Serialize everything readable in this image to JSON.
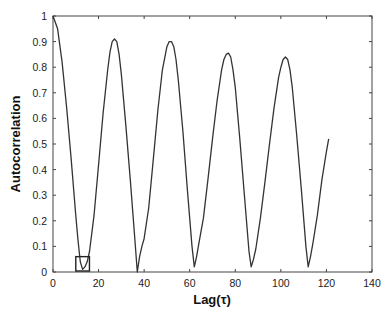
{
  "chart_data": {
    "type": "line",
    "title": "",
    "xlabel": "Lag(τ)",
    "ylabel": "Autocorrelation",
    "xlim": [
      0,
      140
    ],
    "ylim": [
      0,
      1
    ],
    "xticks": [
      0,
      20,
      40,
      60,
      80,
      100,
      120,
      140
    ],
    "yticks": [
      0,
      0.1,
      0.2,
      0.3,
      0.4,
      0.5,
      0.6,
      0.7,
      0.8,
      0.9,
      1
    ],
    "grid": false,
    "legend": null,
    "series": [
      {
        "name": "autocorrelation",
        "color": "#333333",
        "x": [
          0,
          2,
          4,
          6,
          8,
          10,
          11,
          12,
          13,
          14,
          15,
          16,
          18,
          20,
          22,
          24,
          25,
          26,
          27,
          28,
          29,
          30,
          32,
          34,
          36,
          37,
          38,
          39,
          40,
          42,
          44,
          46,
          48,
          50,
          51,
          52,
          53,
          54,
          55,
          57,
          59,
          61,
          62,
          63,
          64,
          66,
          68,
          70,
          72,
          74,
          75,
          76,
          77,
          78,
          79,
          80,
          82,
          84,
          86,
          87,
          88,
          89,
          91,
          93,
          95,
          97,
          99,
          100,
          101,
          102,
          103,
          104,
          105,
          107,
          109,
          111,
          112,
          113,
          114,
          116,
          118,
          120,
          121
        ],
        "y": [
          1.0,
          0.95,
          0.82,
          0.64,
          0.44,
          0.22,
          0.12,
          0.04,
          0.01,
          0.02,
          0.04,
          0.08,
          0.22,
          0.42,
          0.62,
          0.79,
          0.86,
          0.9,
          0.91,
          0.9,
          0.85,
          0.77,
          0.57,
          0.35,
          0.12,
          0.0,
          0.06,
          0.1,
          0.13,
          0.25,
          0.44,
          0.63,
          0.79,
          0.88,
          0.9,
          0.9,
          0.88,
          0.83,
          0.75,
          0.55,
          0.32,
          0.1,
          0.02,
          0.06,
          0.11,
          0.21,
          0.36,
          0.52,
          0.67,
          0.79,
          0.83,
          0.85,
          0.855,
          0.84,
          0.79,
          0.72,
          0.52,
          0.3,
          0.08,
          0.02,
          0.05,
          0.09,
          0.21,
          0.35,
          0.5,
          0.64,
          0.76,
          0.8,
          0.83,
          0.84,
          0.83,
          0.79,
          0.72,
          0.53,
          0.32,
          0.1,
          0.02,
          0.06,
          0.11,
          0.22,
          0.36,
          0.47,
          0.52
        ]
      }
    ],
    "annotations": [
      {
        "type": "rectangle",
        "x0": 10,
        "x1": 16,
        "y0": 0.0,
        "y1": 0.06,
        "color": "#222222"
      }
    ]
  }
}
